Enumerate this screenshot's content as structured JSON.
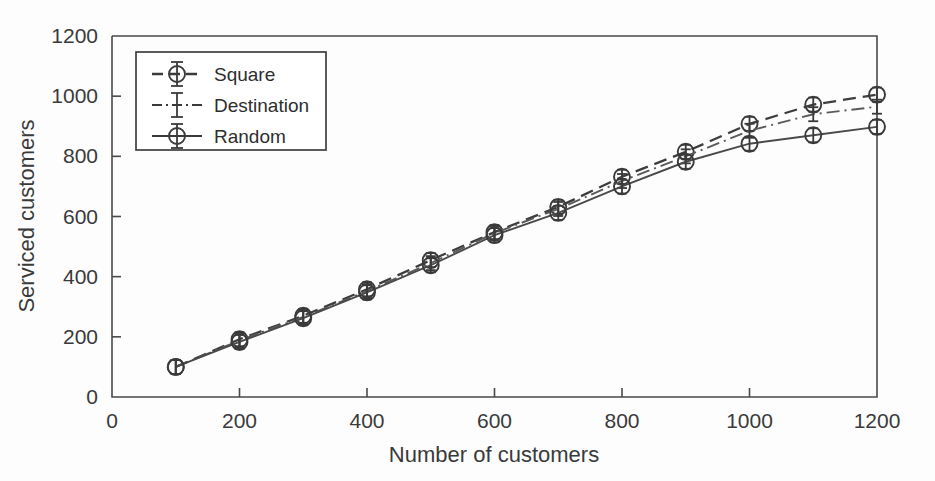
{
  "figure": {
    "background_color": "#fdfdfd",
    "axis_color": "#4a4a4a",
    "text_color": "#3a3a3a"
  },
  "chart_data": {
    "type": "line",
    "title": "",
    "xlabel": "Number of customers",
    "ylabel": "Serviced customers",
    "xlim": [
      0,
      1200
    ],
    "ylim": [
      0,
      1200
    ],
    "xticks": [
      0,
      200,
      400,
      600,
      800,
      1000,
      1200
    ],
    "yticks": [
      0,
      200,
      400,
      600,
      800,
      1000,
      1200
    ],
    "xtick_labels": [
      "0",
      "200",
      "400",
      "600",
      "800",
      "1000",
      "1200"
    ],
    "ytick_labels": [
      "0",
      "200",
      "400",
      "600",
      "800",
      "1000",
      "1200"
    ],
    "grid": false,
    "legend_position": "upper left",
    "x": [
      100,
      200,
      300,
      400,
      500,
      600,
      700,
      800,
      900,
      1000,
      1100,
      1200
    ],
    "series": [
      {
        "name": "Square",
        "line_style": "dashed",
        "marker": "circle-errorbar",
        "color": "#3d3d3d",
        "values": [
          100,
          192,
          270,
          358,
          455,
          548,
          632,
          732,
          815,
          908,
          972,
          1005
        ]
      },
      {
        "name": "Destination",
        "line_style": "dash-dot",
        "marker": "errorbar",
        "color": "#5a5a5a",
        "values": [
          100,
          188,
          266,
          352,
          445,
          545,
          625,
          718,
          800,
          885,
          940,
          965
        ]
      },
      {
        "name": "Random",
        "line_style": "solid",
        "marker": "circle-errorbar",
        "color": "#4a4a4a",
        "values": [
          100,
          183,
          262,
          348,
          438,
          538,
          612,
          700,
          782,
          842,
          870,
          898
        ]
      }
    ],
    "error_bars": {
      "enabled": true,
      "magnitude": 10
    }
  },
  "legend": {
    "entries": [
      {
        "label": "Square",
        "style": "dashed"
      },
      {
        "label": "Destination",
        "style": "dash-dot"
      },
      {
        "label": "Random",
        "style": "solid"
      }
    ]
  }
}
